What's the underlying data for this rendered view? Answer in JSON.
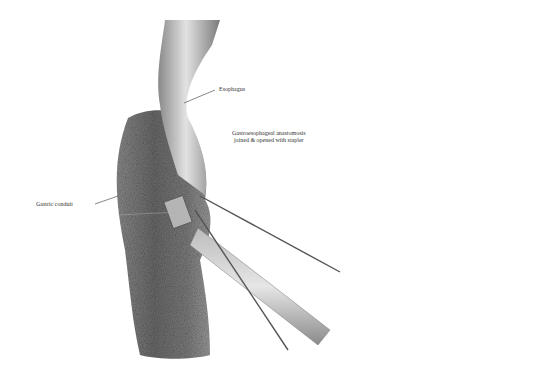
{
  "figure": {
    "labels": {
      "esophagus": "Esophagus",
      "anastomosis_line1": "Gastroesophageal anastomosis",
      "anastomosis_line2": "joined & opened with stapler",
      "gastric_conduit": "Gastric conduit"
    },
    "colors": {
      "background": "#ffffff",
      "tissue_dark": "#6e6e6e",
      "tissue_mid": "#9a9a9a",
      "tissue_light": "#d6d6d6",
      "leader_line": "#555555"
    }
  }
}
